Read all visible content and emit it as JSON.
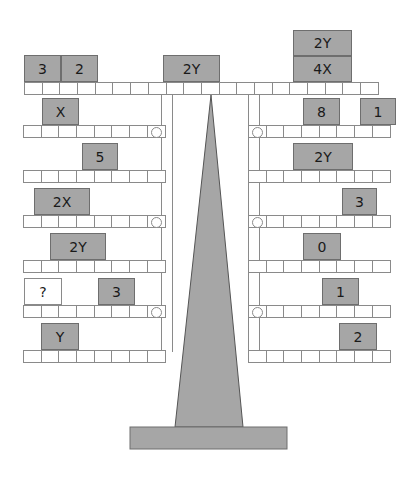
{
  "diagram": {
    "colors": {
      "block": "#a6a6a6",
      "stand": "#a6a6a6",
      "outline": "#8a8a8a"
    },
    "top_beam": {
      "cells": 20,
      "left_blocks": [
        {
          "label": "3",
          "x": 24,
          "y": 55,
          "w": 37,
          "h": 27
        },
        {
          "label": "2",
          "x": 61,
          "y": 55,
          "w": 37,
          "h": 27
        },
        {
          "label": "2Y",
          "x": 163,
          "y": 55,
          "w": 57,
          "h": 27
        }
      ],
      "right_blocks": [
        {
          "label": "2Y",
          "x": 293,
          "y": 30,
          "w": 59,
          "h": 26
        },
        {
          "label": "4X",
          "x": 293,
          "y": 56,
          "w": 59,
          "h": 26
        }
      ]
    },
    "left_shelves": [
      {
        "ring": true,
        "blocks": [
          {
            "label": "X",
            "x": 42,
            "w": 37
          }
        ]
      },
      {
        "ring": false,
        "blocks": [
          {
            "label": "5",
            "x": 82,
            "w": 36
          }
        ]
      },
      {
        "ring": true,
        "blocks": [
          {
            "label": "2X",
            "x": 34,
            "w": 56
          }
        ]
      },
      {
        "ring": false,
        "blocks": [
          {
            "label": "2Y",
            "x": 50,
            "w": 56
          }
        ]
      },
      {
        "ring": true,
        "blocks": [
          {
            "label": "?",
            "x": 24,
            "w": 38,
            "blank": true
          },
          {
            "label": "3",
            "x": 98,
            "w": 37
          }
        ]
      },
      {
        "ring": false,
        "blocks": [
          {
            "label": "Y",
            "x": 41,
            "w": 38
          }
        ]
      }
    ],
    "right_shelves": [
      {
        "ring": true,
        "blocks": [
          {
            "label": "8",
            "x": 303,
            "w": 37
          },
          {
            "label": "1",
            "x": 360,
            "w": 36
          }
        ]
      },
      {
        "ring": false,
        "blocks": [
          {
            "label": "2Y",
            "x": 293,
            "w": 60
          }
        ]
      },
      {
        "ring": true,
        "blocks": [
          {
            "label": "3",
            "x": 342,
            "w": 35
          }
        ]
      },
      {
        "ring": false,
        "blocks": [
          {
            "label": "0",
            "x": 303,
            "w": 38
          }
        ]
      },
      {
        "ring": true,
        "blocks": [
          {
            "label": "1",
            "x": 322,
            "w": 37
          }
        ]
      },
      {
        "ring": false,
        "blocks": [
          {
            "label": "2",
            "x": 339,
            "w": 38
          }
        ]
      }
    ],
    "unknown_label": "?"
  }
}
